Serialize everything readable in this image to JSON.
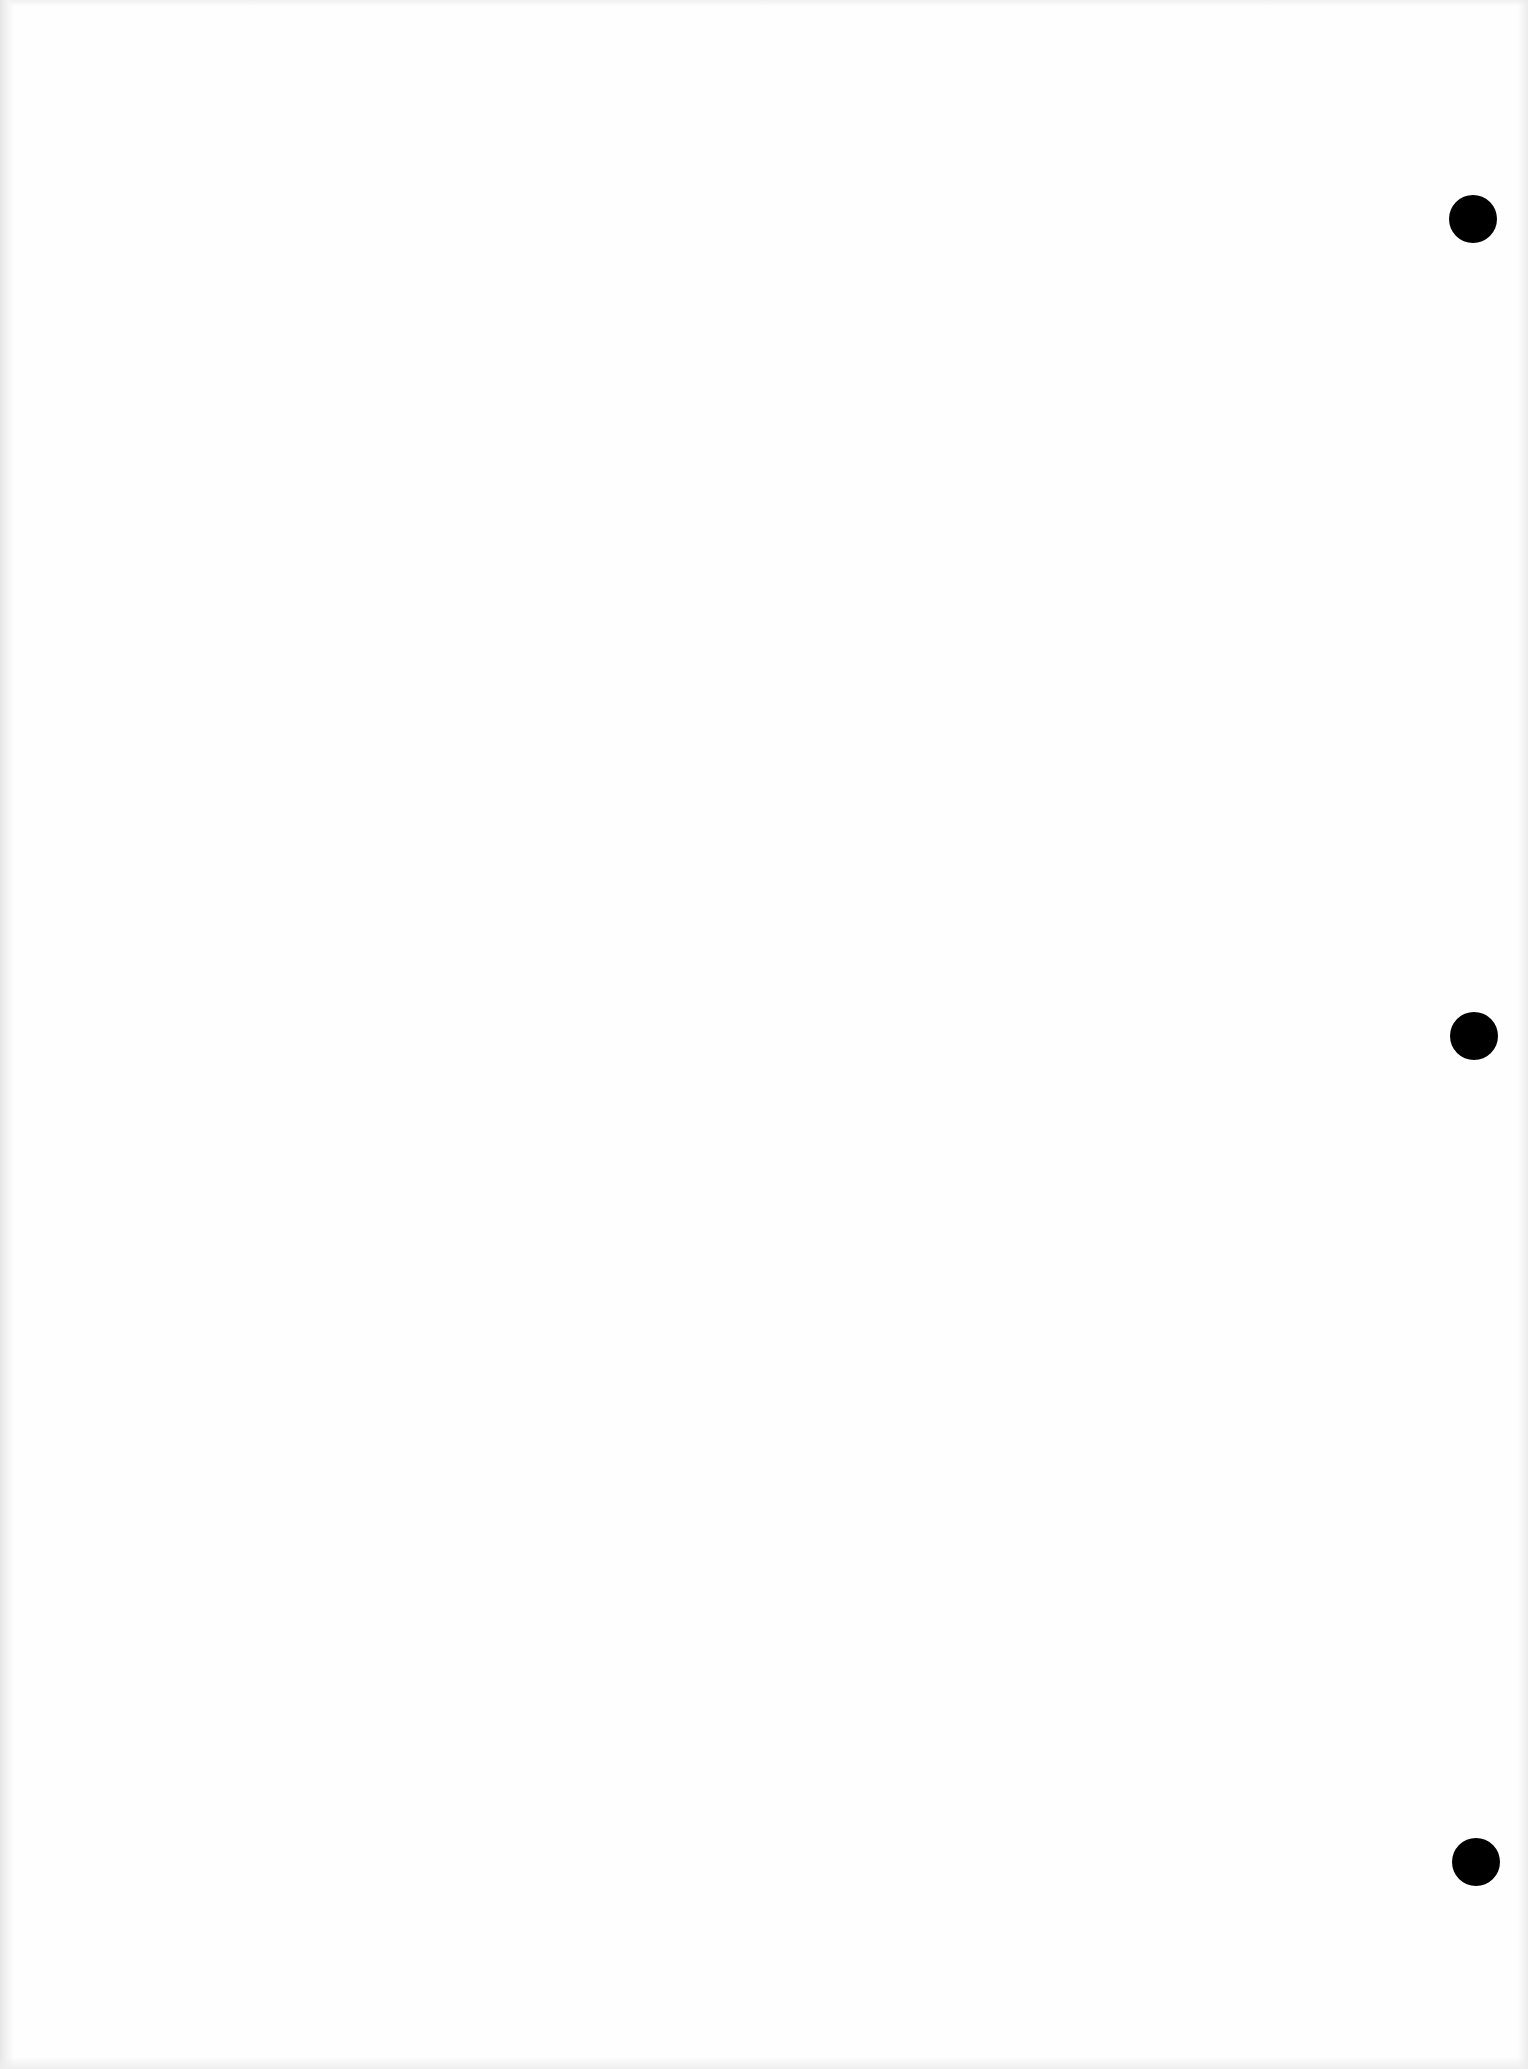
{
  "document": {
    "type": "blank three-hole-punched sheet",
    "paper_color": "#fefefe",
    "text_content": ""
  },
  "punch_holes": [
    {
      "label": "top",
      "cx": 1473,
      "cy": 219,
      "diameter": 48,
      "color": "#000000"
    },
    {
      "label": "middle",
      "cx": 1474,
      "cy": 1036,
      "diameter": 48,
      "color": "#000000"
    },
    {
      "label": "bottom",
      "cx": 1476,
      "cy": 1862,
      "diameter": 48,
      "color": "#000000"
    }
  ]
}
